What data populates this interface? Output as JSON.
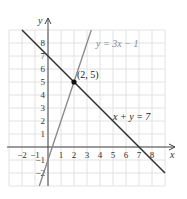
{
  "chart_data": {
    "type": "line",
    "title": "",
    "xlabel": "x",
    "ylabel": "y",
    "xlim": [
      -3,
      9
    ],
    "ylim": [
      -3,
      9
    ],
    "grid": true,
    "x_ticks": [
      "-2",
      "-1",
      "1",
      "2",
      "3",
      "4",
      "5",
      "6",
      "7",
      "8"
    ],
    "y_ticks": [
      "-2",
      "-1",
      "1",
      "2",
      "3",
      "4",
      "5",
      "6",
      "7",
      "8"
    ],
    "series": [
      {
        "name": "x + y = 7",
        "equation": "x + y = 7",
        "color": "#333333",
        "points": [
          [
            -2,
            9
          ],
          [
            9,
            -2
          ]
        ]
      },
      {
        "name": "y = 3x − 1",
        "equation": "y = 3x − 1",
        "color": "#888888",
        "points": [
          [
            -0.67,
            -3
          ],
          [
            3.33,
            9
          ]
        ]
      }
    ],
    "annotations": [
      {
        "text": "(2, 5)",
        "x": 2,
        "y": 5,
        "type": "intersection-point"
      }
    ]
  },
  "labels": {
    "x_axis": "x",
    "y_axis": "y",
    "line1": "x + y = 7",
    "line2": "y = 3x − 1",
    "point": "(2, 5)"
  }
}
